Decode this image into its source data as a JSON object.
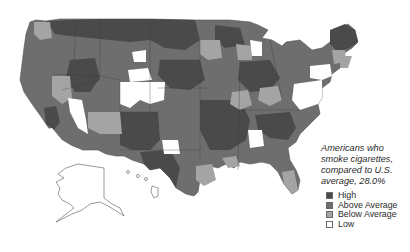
{
  "map": {
    "subject": "US counties / regions shaded by smoking rate compared to national average",
    "regions_shown": [
      "Contiguous United States",
      "Alaska",
      "Hawaii"
    ],
    "colors": {
      "high": "#4a4a4a",
      "above_average": "#6e6e6e",
      "below_average": "#a4a4a4",
      "low": "#ffffff",
      "outline": "#555555"
    }
  },
  "caption": {
    "line1": "Americans who",
    "line2": "smoke cigarettes,",
    "line3": "compared to U.S.",
    "line4": "average, 28.0%"
  },
  "legend": {
    "items": [
      {
        "label": "High",
        "color": "#4a4a4a"
      },
      {
        "label": "Above Average",
        "color": "#6e6e6e"
      },
      {
        "label": "Below Average",
        "color": "#a4a4a4"
      },
      {
        "label": "Low",
        "color": "#ffffff"
      }
    ]
  }
}
